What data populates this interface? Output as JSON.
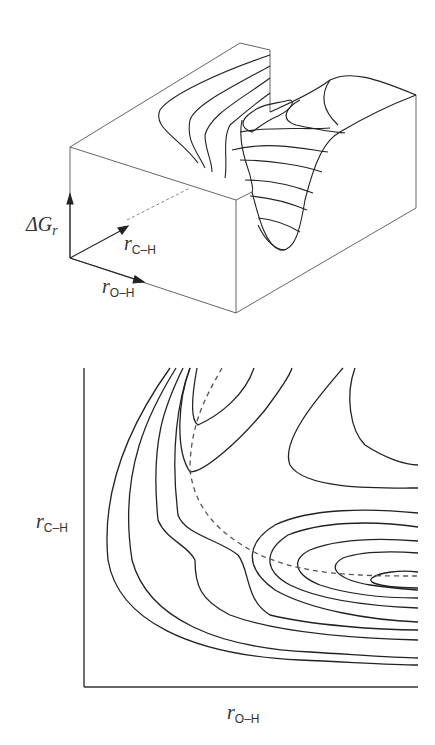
{
  "figure": {
    "top_panel": {
      "type": "3d-free-energy-surface",
      "axis_labels": {
        "vertical": {
          "symbol": "ΔG",
          "subscript": "r"
        },
        "depth": {
          "symbol": "r",
          "subscript": "C–H"
        },
        "horizontal": {
          "symbol": "r",
          "subscript": "O–H"
        }
      }
    },
    "bottom_panel": {
      "type": "contour-map",
      "axis_labels": {
        "y": {
          "symbol": "r",
          "subscript": "C–H"
        },
        "x": {
          "symbol": "r",
          "subscript": "O–H"
        }
      },
      "reaction_path": "dashed"
    },
    "colors": {
      "line": "#222222",
      "box_edge": "#555555",
      "dashed": "#555555",
      "background": "#ffffff"
    }
  }
}
